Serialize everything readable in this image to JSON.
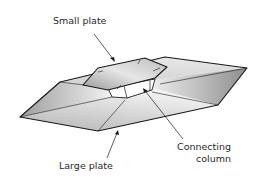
{
  "figure": {
    "type": "technical-illustration",
    "labels": {
      "small_plate": "Small plate",
      "connecting_column_line1": "Connecting",
      "connecting_column_line2": "column",
      "large_plate": "Large plate"
    },
    "colors": {
      "outline": "#1a1a1a",
      "face_light": "#f4f4f4",
      "face_mid": "#d6d6d6",
      "face_dark": "#a8a8a8",
      "text": "#2a2a2a"
    }
  }
}
